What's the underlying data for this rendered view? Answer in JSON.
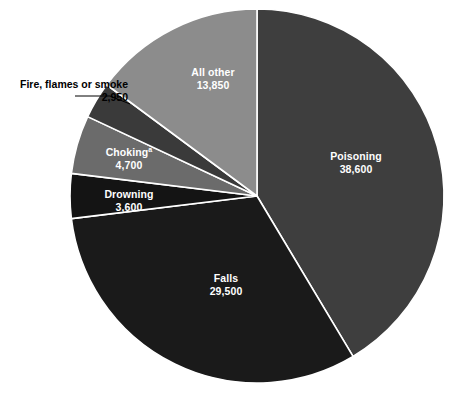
{
  "chart_data": {
    "type": "pie",
    "title": "",
    "subtitle": "",
    "xlabel": "",
    "ylabel": "",
    "legend_position": "none",
    "grid": false,
    "total": 93200,
    "start_angle_deg": 0,
    "direction": "clockwise",
    "categories": [
      "Poisoning",
      "Falls",
      "Drowning",
      "Choking",
      "Fire, flames or smoke",
      "All other"
    ],
    "values": [
      38600,
      29500,
      3600,
      4700,
      2950,
      13850
    ],
    "value_labels": [
      "38,600",
      "29,500",
      "3,600",
      "4,700",
      "2,950",
      "13,850"
    ],
    "colors": [
      "#3e3e3e",
      "#1a1a1a",
      "#141414",
      "#6b6b6b",
      "#3a3a3a",
      "#8c8c8c"
    ],
    "slices": [
      {
        "name": "Poisoning",
        "value": 38600,
        "value_label": "38,600",
        "color": "#3e3e3e",
        "label_placement": "inside",
        "label_color": "#ffffff"
      },
      {
        "name": "Falls",
        "value": 29500,
        "value_label": "29,500",
        "color": "#1a1a1a",
        "label_placement": "inside",
        "label_color": "#ffffff"
      },
      {
        "name": "Drowning",
        "value": 3600,
        "value_label": "3,600",
        "color": "#141414",
        "label_placement": "inside",
        "label_color": "#ffffff"
      },
      {
        "name": "Choking",
        "name_superscript": "a",
        "value": 4700,
        "value_label": "4,700",
        "color": "#6b6b6b",
        "label_placement": "inside",
        "label_color": "#ffffff"
      },
      {
        "name": "Fire, flames or smoke",
        "value": 2950,
        "value_label": "2,950",
        "color": "#3a3a3a",
        "label_placement": "callout",
        "label_color": "#000000"
      },
      {
        "name": "All other",
        "value": 13850,
        "value_label": "13,850",
        "color": "#8c8c8c",
        "label_placement": "inside",
        "label_color": "#ffffff"
      }
    ],
    "separator_color": "#ffffff",
    "background": "#ffffff"
  },
  "labels": {
    "poisoning": {
      "name": "Poisoning",
      "value": "38,600"
    },
    "falls": {
      "name": "Falls",
      "value": "29,500"
    },
    "drowning": {
      "name": "Drowning",
      "value": "3,600"
    },
    "choking": {
      "name": "Choking",
      "superscript": "a",
      "value": "4,700"
    },
    "fire": {
      "name": "Fire, flames or smoke",
      "value": "2,950"
    },
    "all_other": {
      "name": "All other",
      "value": "13,850"
    }
  }
}
